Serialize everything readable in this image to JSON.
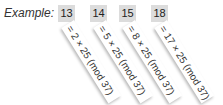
{
  "label": "Example:",
  "items": [
    {
      "number": "13",
      "expr": "= 2 × 25 (mod 37)"
    },
    {
      "number": "14",
      "expr": "= 5 × 25 (mod 37)"
    },
    {
      "number": "15",
      "expr": "= 8 × 25 (mod 37)"
    },
    {
      "number": "18",
      "expr": "= 17 × 25 (mod 37)"
    }
  ]
}
